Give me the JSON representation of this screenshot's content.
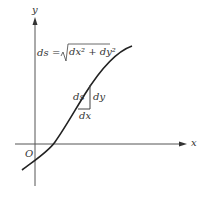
{
  "diagram": {
    "axes": {
      "x_label": "x",
      "y_label": "y",
      "origin_label": "O"
    },
    "formula": {
      "lhs": "ds",
      "equals": "=",
      "sqrt_symbol": "√",
      "radicand": "dx² + dy²"
    },
    "triangle_labels": {
      "hypotenuse": "ds",
      "vertical": "dy",
      "horizontal": "dx"
    },
    "colors": {
      "axis": "#555555",
      "curve": "#222222",
      "text": "#333333"
    }
  }
}
